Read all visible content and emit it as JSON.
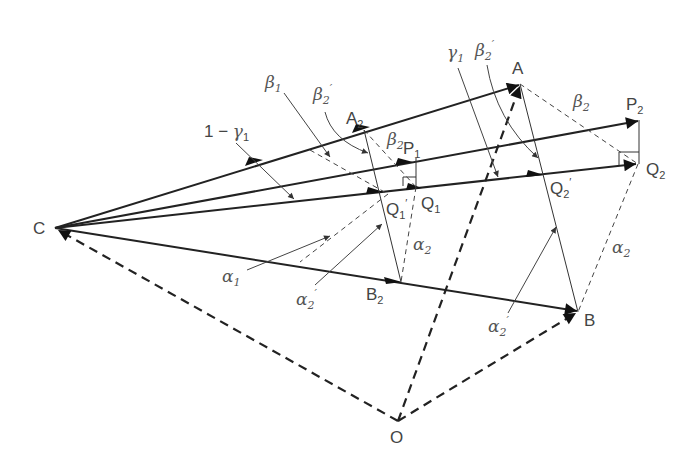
{
  "diagram": {
    "points": {
      "C": {
        "label": "C",
        "x": 55,
        "y": 228
      },
      "A": {
        "label": "A",
        "x": 520,
        "y": 84
      },
      "B": {
        "label": "B",
        "x": 578,
        "y": 312
      },
      "O": {
        "label": "O",
        "x": 398,
        "y": 421
      },
      "A2": {
        "label": "A",
        "sub": "2",
        "x": 364,
        "y": 130
      },
      "B2": {
        "label": "B",
        "sub": "2",
        "x": 400,
        "y": 282
      },
      "P1": {
        "label": "P",
        "sub": "1",
        "x": 414,
        "y": 160
      },
      "Q1": {
        "label": "Q",
        "sub": "1",
        "x": 416,
        "y": 187
      },
      "Q1p": {
        "label": "Q",
        "sub": "1",
        "prime": "′",
        "x": 388,
        "y": 194
      },
      "P2": {
        "label": "P",
        "sub": "2",
        "x": 640,
        "y": 120
      },
      "Q2": {
        "label": "Q",
        "sub": "2",
        "x": 638,
        "y": 164
      },
      "Q2p": {
        "label": "Q",
        "sub": "2",
        "prime": "′",
        "x": 547,
        "y": 175
      }
    },
    "greek_labels": {
      "beta1": {
        "sym": "β",
        "sub": "1"
      },
      "beta2p_left": {
        "sym": "β",
        "sub": "2",
        "prime": "′"
      },
      "beta2p_right": {
        "sym": "β",
        "sub": "2",
        "prime": "′"
      },
      "gamma1": {
        "sym": "γ",
        "sub": "1"
      },
      "one_minus_gamma1": {
        "prefix": "1 − ",
        "sym": "γ",
        "sub": "1"
      },
      "beta2_mid": {
        "sym": "β",
        "sub": "2"
      },
      "beta2_right": {
        "sym": "β",
        "sub": "2"
      },
      "alpha1": {
        "sym": "α",
        "sub": "1"
      },
      "alpha2p_left": {
        "sym": "α",
        "sub": "2",
        "prime": "′"
      },
      "alpha2p_right": {
        "sym": "α",
        "sub": "2",
        "prime": "′"
      },
      "alpha2_mid": {
        "sym": "α",
        "sub": "2"
      },
      "alpha2_right": {
        "sym": "α",
        "sub": "2"
      }
    },
    "vectors": [
      {
        "from": "C",
        "to": "A",
        "style": "solid"
      },
      {
        "from": "C",
        "to": "P2",
        "style": "solid"
      },
      {
        "from": "C",
        "to": "Q2",
        "style": "solid"
      },
      {
        "from": "C",
        "to": "B",
        "style": "solid"
      },
      {
        "from": "O",
        "to": "C",
        "style": "dashed"
      },
      {
        "from": "O",
        "to": "A",
        "style": "dashed"
      },
      {
        "from": "O",
        "to": "B",
        "style": "dashed"
      }
    ]
  }
}
